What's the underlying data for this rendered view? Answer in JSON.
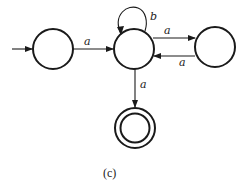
{
  "diagram": {
    "type": "finite-automaton",
    "caption": "(c)",
    "states": [
      {
        "id": "q0",
        "start": true,
        "accept": false
      },
      {
        "id": "q1",
        "start": false,
        "accept": false
      },
      {
        "id": "q2",
        "start": false,
        "accept": false
      },
      {
        "id": "q3",
        "start": false,
        "accept": true
      }
    ],
    "transitions": [
      {
        "from": "q0",
        "to": "q1",
        "label": "a"
      },
      {
        "from": "q1",
        "to": "q1",
        "label": "b"
      },
      {
        "from": "q1",
        "to": "q2",
        "label": "a"
      },
      {
        "from": "q2",
        "to": "q1",
        "label": "a"
      },
      {
        "from": "q1",
        "to": "q3",
        "label": "a"
      }
    ]
  }
}
